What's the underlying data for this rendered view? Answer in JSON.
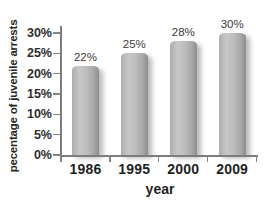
{
  "chart_data": {
    "type": "bar",
    "title": "",
    "ylabel": "pecentage of juvenile arrests",
    "xlabel": "year",
    "categories": [
      "1986",
      "1995",
      "2000",
      "2009"
    ],
    "values": [
      22,
      25,
      28,
      30
    ],
    "value_labels": [
      "22%",
      "25%",
      "28%",
      "30%"
    ],
    "ytick_labels": [
      "0%",
      "5%",
      "10%",
      "15%",
      "20%",
      "25%",
      "30%"
    ],
    "ylim": [
      0,
      30
    ],
    "grid": false,
    "legend_position": "none",
    "colors": {
      "bar": "#b9b9b9",
      "bar_edge_dark": "#8d8d8d",
      "axis": "#7d7d7d",
      "text": "#262626",
      "background": "#ffffff"
    }
  }
}
